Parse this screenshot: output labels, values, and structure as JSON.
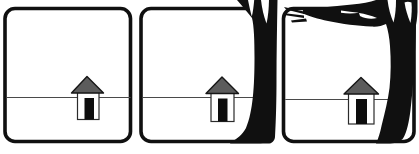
{
  "scene": {
    "description": "Three-panel black-and-white line-art sequence: a small house sits on a horizon line; a bare black tree silhouette appears at the right edge of the second panel and looms much larger, branching across the top, in the third panel.",
    "panel_count": 3
  },
  "colors": {
    "ink": "#101010",
    "roof": "#5c5c5c",
    "door": "#0d0d0d",
    "horizon": "#4a4a4a",
    "background": "#ffffff"
  },
  "panels": [
    {
      "id": "panel-1",
      "tree": "none",
      "contents": "house on horizon line, empty sky"
    },
    {
      "id": "panel-2",
      "tree": "medium",
      "contents": "house on horizon line; tree trunk with forked top along right edge"
    },
    {
      "id": "panel-3",
      "tree": "large",
      "contents": "house on horizon line; large tree at right with branch and twigs spreading across the top"
    }
  ],
  "house": {
    "parts": [
      "gray triangular roof",
      "white square body",
      "black door"
    ]
  }
}
